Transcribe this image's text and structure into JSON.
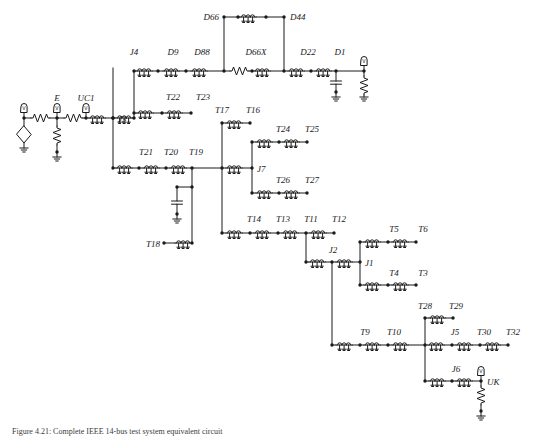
{
  "figure": {
    "caption": "Figure 4.21: Complete IEEE 14-bus test system equivalent circuit",
    "background_color": "#ffffff",
    "line_color": "#1a1a1a"
  },
  "labels": {
    "source_E": "E",
    "uc1": "UC1",
    "j3": "J3",
    "j4": "J4",
    "d9": "D9",
    "d88": "D88",
    "d66": "D66",
    "d44": "D44",
    "d66x": "D66X",
    "d22": "D22",
    "d1": "D1",
    "t22": "T22",
    "t23": "T23",
    "t21": "T21",
    "t20": "T20",
    "t19": "T19",
    "t18": "T18",
    "t17": "T17",
    "t16": "T16",
    "t24": "T24",
    "t25": "T25",
    "j7": "J7",
    "t26": "T26",
    "t27": "T27",
    "t14": "T14",
    "t13": "T13",
    "t11": "T11",
    "t12": "T12",
    "j2": "J2",
    "j1": "J1",
    "t5": "T5",
    "t6": "T6",
    "t4": "T4",
    "t3": "T3",
    "t28": "T28",
    "t29": "T29",
    "t9": "T9",
    "t10": "T10",
    "j5": "J5",
    "t30": "T30",
    "t32": "T32",
    "j6": "J6",
    "uk": "UK"
  },
  "components": {
    "transmission_lines": [
      "J4",
      "D9",
      "D88",
      "D66",
      "D44",
      "D66X",
      "D22",
      "D1",
      "T22",
      "T23",
      "T21",
      "T20",
      "T19",
      "T18",
      "T17",
      "T16",
      "T24",
      "T25",
      "J7",
      "T26",
      "T27",
      "T14",
      "T13",
      "T11",
      "T12",
      "J2",
      "J1",
      "T5",
      "T6",
      "T4",
      "T3",
      "T28",
      "T29",
      "T9",
      "T10",
      "J5",
      "T30",
      "T32",
      "J6",
      "J3",
      "UC1"
    ],
    "resistors": [
      "source-series-R1",
      "E-shunt-R",
      "source-series-R2",
      "D66X-series-R",
      "D1-load-R",
      "UK-load-R"
    ],
    "capacitors": [
      "D1-shunt-C",
      "T19-shunt-C"
    ],
    "grounds": [
      "source-gnd",
      "E-gnd",
      "D1-cap-gnd",
      "D1-res-gnd",
      "T19-cap-gnd",
      "UK-gnd"
    ],
    "voltage_sources": [
      "Vs"
    ],
    "probes": [
      "probe-source",
      "probe-E",
      "probe-UC1",
      "probe-D1",
      "probe-UK"
    ]
  },
  "probe_glyph": "V"
}
